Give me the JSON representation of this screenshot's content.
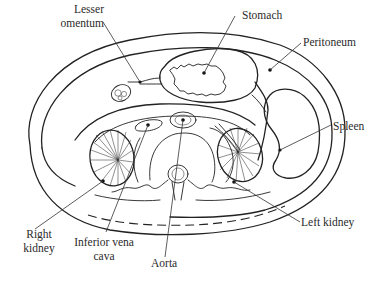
{
  "diagram": {
    "title": "",
    "type": "anatomical cross-section of the abdomen",
    "colors": {
      "ink": "#222222",
      "background": "#ffffff",
      "label_text": "#2a2a2a"
    },
    "labels": {
      "lesser_omentum_1": "Lesser",
      "lesser_omentum_2": "omentum",
      "stomach": "Stomach",
      "peritoneum": "Peritoneum",
      "spleen": "Spleen",
      "left_kidney": "Left kidney",
      "right_kidney_1": "Right",
      "right_kidney_2": "kidney",
      "ivc_1": "Inferior vena",
      "ivc_2": "cava",
      "aorta": "Aorta"
    },
    "structures": [
      "Lesser omentum",
      "Stomach",
      "Peritoneum",
      "Spleen",
      "Left kidney",
      "Right kidney",
      "Inferior vena cava",
      "Aorta"
    ]
  }
}
